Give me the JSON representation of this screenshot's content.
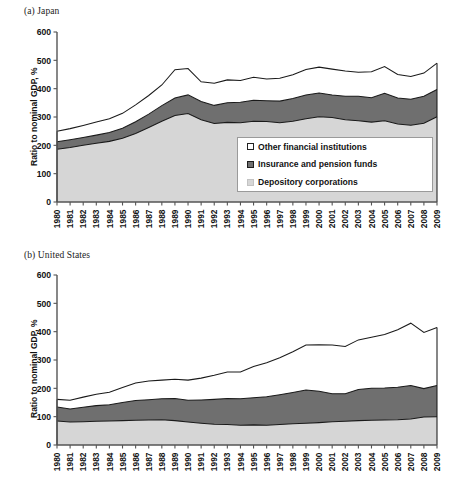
{
  "figure": {
    "panels": [
      {
        "key": "a",
        "title": "(a) Japan"
      },
      {
        "key": "b",
        "title": "(b) United States"
      }
    ],
    "axis_title": "Ratio to nominal GDP, %",
    "legend": {
      "other_label": "Other financial institutions",
      "insurance_label": "Insurance and pension funds",
      "depository_label": "Depository corporations",
      "other_color": "#ffffff",
      "insurance_color": "#6f6f6f",
      "depository_color": "#d6d6d6"
    }
  },
  "chart_data": [
    {
      "type": "area",
      "stacked": true,
      "title": "(a) Japan",
      "xlabel": "",
      "ylabel": "Ratio to nominal GDP, %",
      "ylim": [
        0,
        600
      ],
      "yticks": [
        0,
        100,
        200,
        300,
        400,
        500,
        600
      ],
      "grid": false,
      "legend_position": "inside-right",
      "categories": [
        "1980",
        "1981",
        "1982",
        "1983",
        "1984",
        "1985",
        "1986",
        "1987",
        "1988",
        "1989",
        "1990",
        "1991",
        "1992",
        "1993",
        "1994",
        "1995",
        "1996",
        "1997",
        "1998",
        "1999",
        "2000",
        "2001",
        "2002",
        "2003",
        "2004",
        "2005",
        "2006",
        "2007",
        "2008",
        "2009"
      ],
      "series": [
        {
          "name": "Depository corporations",
          "color": "#d6d6d6",
          "values": [
            186,
            192,
            200,
            207,
            214,
            225,
            242,
            263,
            285,
            305,
            312,
            290,
            277,
            281,
            280,
            285,
            284,
            280,
            285,
            294,
            301,
            298,
            290,
            287,
            282,
            287,
            275,
            271,
            278,
            301
          ]
        },
        {
          "name": "Insurance and pension funds",
          "color": "#6f6f6f",
          "values": [
            27,
            28,
            28,
            29,
            31,
            35,
            41,
            47,
            55,
            62,
            66,
            65,
            64,
            69,
            72,
            74,
            73,
            76,
            80,
            84,
            84,
            80,
            83,
            86,
            86,
            97,
            92,
            92,
            95,
            96
          ]
        },
        {
          "name": "Other financial institutions",
          "color": "#ffffff",
          "values": [
            37,
            39,
            42,
            46,
            49,
            53,
            60,
            66,
            73,
            100,
            93,
            69,
            78,
            81,
            77,
            81,
            77,
            81,
            84,
            90,
            91,
            91,
            89,
            85,
            92,
            94,
            83,
            80,
            82,
            93
          ]
        }
      ],
      "totals": [
        250,
        259,
        270,
        282,
        294,
        313,
        343,
        376,
        413,
        467,
        471,
        424,
        419,
        431,
        429,
        440,
        434,
        437,
        449,
        468,
        476,
        469,
        462,
        458,
        460,
        478,
        450,
        443,
        455,
        490
      ]
    },
    {
      "type": "area",
      "stacked": true,
      "title": "(b) United States",
      "xlabel": "",
      "ylabel": "Ratio to nominal GDP, %",
      "ylim": [
        0,
        600
      ],
      "yticks": [
        0,
        100,
        200,
        300,
        400,
        500,
        600
      ],
      "grid": false,
      "legend_position": "inside-left",
      "categories": [
        "1980",
        "1981",
        "1982",
        "1983",
        "1984",
        "1985",
        "1986",
        "1987",
        "1988",
        "1989",
        "1990",
        "1991",
        "1992",
        "1993",
        "1994",
        "1995",
        "1996",
        "1997",
        "1998",
        "1999",
        "2000",
        "2001",
        "2002",
        "2003",
        "2004",
        "2005",
        "2006",
        "2007",
        "2008",
        "2009"
      ],
      "series": [
        {
          "name": "Depository corporations",
          "color": "#d6d6d6",
          "values": [
            85,
            81,
            82,
            84,
            85,
            86,
            87,
            88,
            89,
            86,
            81,
            77,
            73,
            72,
            70,
            71,
            70,
            72,
            75,
            77,
            79,
            82,
            84,
            86,
            87,
            88,
            89,
            92,
            99,
            100
          ]
        },
        {
          "name": "Insurance and pension funds",
          "color": "#6f6f6f",
          "values": [
            49,
            46,
            51,
            55,
            57,
            64,
            70,
            72,
            74,
            78,
            77,
            82,
            88,
            92,
            93,
            96,
            100,
            105,
            110,
            117,
            111,
            99,
            97,
            110,
            113,
            113,
            115,
            118,
            100,
            110
          ]
        },
        {
          "name": "Other financial institutions",
          "color": "#ffffff",
          "values": [
            27,
            31,
            36,
            40,
            44,
            53,
            62,
            66,
            66,
            68,
            71,
            77,
            85,
            94,
            95,
            110,
            120,
            131,
            144,
            159,
            164,
            172,
            167,
            175,
            180,
            189,
            203,
            220,
            198,
            205
          ]
        }
      ],
      "totals": [
        161,
        158,
        169,
        179,
        186,
        203,
        219,
        226,
        229,
        232,
        229,
        236,
        246,
        258,
        258,
        277,
        290,
        308,
        329,
        353,
        354,
        353,
        348,
        371,
        380,
        390,
        407,
        430,
        397,
        415
      ]
    }
  ]
}
